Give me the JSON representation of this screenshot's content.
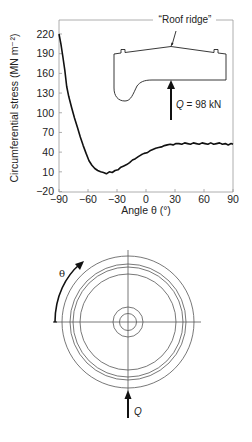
{
  "chart_data": {
    "type": "line",
    "title": "",
    "xlabel": "Angle θ (°)",
    "ylabel": "Circumferential stress (MN m⁻²)",
    "xlim": [
      -90,
      90
    ],
    "ylim": [
      -20,
      220
    ],
    "x_ticks": [
      -90,
      -60,
      -30,
      0,
      30,
      60,
      90
    ],
    "y_ticks": [
      -20,
      10,
      40,
      70,
      100,
      130,
      160,
      190,
      220
    ],
    "x_tick_labels": [
      "−90",
      "−60",
      "−30",
      "0",
      "30",
      "60",
      "90"
    ],
    "y_tick_labels": [
      "−20",
      "10",
      "40",
      "70",
      "100",
      "130",
      "160",
      "190",
      "220"
    ],
    "grid": false,
    "series": [
      {
        "name": "Circumferential stress",
        "x": [
          -90,
          -88,
          -86,
          -84,
          -82,
          -80,
          -77,
          -74,
          -71,
          -68,
          -65,
          -62,
          -59,
          -56,
          -53,
          -50,
          -47,
          -44,
          -41,
          -38,
          -35,
          -32,
          -29,
          -26,
          -23,
          -20,
          -17,
          -14,
          -11,
          -8,
          -5,
          -2,
          1,
          4,
          7,
          10,
          13,
          16,
          19,
          22,
          25,
          28,
          31,
          34,
          37,
          40,
          43,
          46,
          49,
          52,
          55,
          58,
          61,
          64,
          67,
          70,
          73,
          76,
          79,
          82,
          85,
          88,
          90
        ],
        "values": [
          220,
          205,
          185,
          165,
          140,
          125,
          108,
          92,
          78,
          63,
          50,
          38,
          27,
          20,
          15,
          12,
          10,
          9,
          7,
          10,
          9,
          12,
          13,
          17,
          19,
          21,
          24,
          28,
          30,
          33,
          36,
          38,
          39,
          42,
          44,
          46,
          47,
          48,
          50,
          51,
          52,
          51,
          53,
          53,
          52,
          54,
          53,
          52,
          54,
          53,
          52,
          54,
          53,
          52,
          54,
          52,
          53,
          54,
          52,
          53,
          51,
          53,
          52
        ]
      }
    ],
    "annotations": [
      "\"Roof ridge\"",
      "Q = 98 kN"
    ]
  },
  "inset": {
    "roof_ridge_label": "“Roof ridge”",
    "load_label_q": "Q",
    "load_label_value": " = 98 kN"
  },
  "wheel_diagram": {
    "angle_label": "θ",
    "load_label": "Q"
  }
}
